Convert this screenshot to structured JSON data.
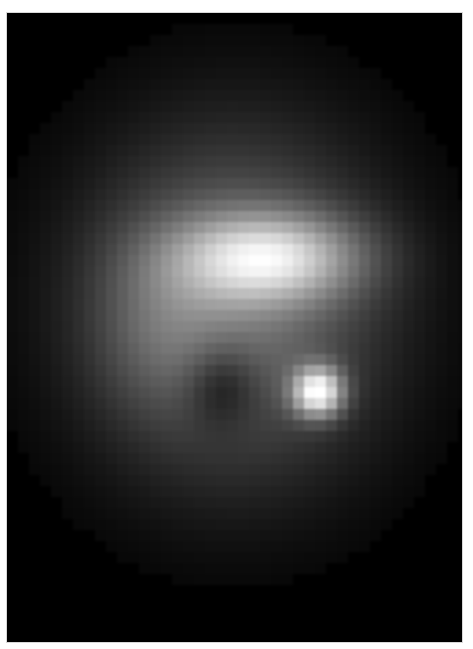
{
  "image": {
    "subject": "pixelated grayscale astronomical-style image of a bright diffuse blob with a brighter compact spot at lower right",
    "background_color": "#000000",
    "border_color": "#ffffff",
    "frame": {
      "x": 7,
      "y": 13,
      "width": 455,
      "height": 629
    },
    "pixel_block_size": 11,
    "components": [
      {
        "name": "halo",
        "cx": 235,
        "cy": 305,
        "sx": 100,
        "sy": 115,
        "amp": 0.42
      },
      {
        "name": "upper-bright-region",
        "cx": 268,
        "cy": 258,
        "sx": 62,
        "sy": 30,
        "amp": 0.62
      },
      {
        "name": "lower-right-spot",
        "cx": 318,
        "cy": 392,
        "sx": 17,
        "sy": 17,
        "amp": 0.85
      },
      {
        "name": "left-lobe",
        "cx": 160,
        "cy": 320,
        "sx": 45,
        "sy": 60,
        "amp": 0.14
      },
      {
        "name": "dark-notch",
        "cx": 222,
        "cy": 385,
        "sx": 26,
        "sy": 30,
        "amp": -0.22
      }
    ]
  }
}
